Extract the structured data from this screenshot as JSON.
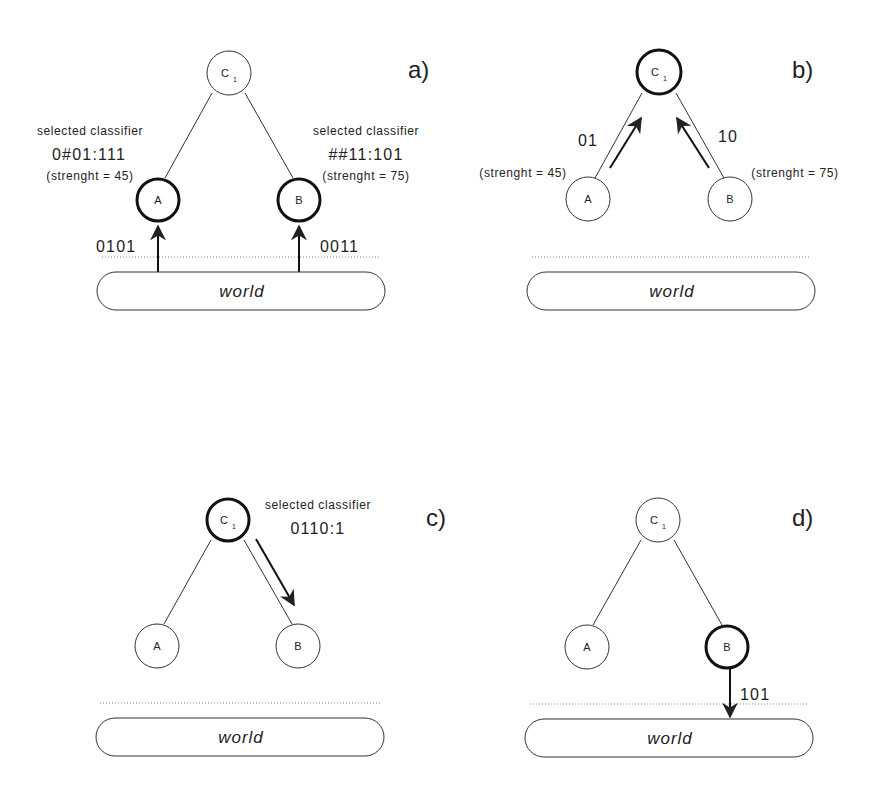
{
  "figure": {
    "panels": [
      {
        "id": "a",
        "label": "a)",
        "nodes": {
          "c1": "C",
          "c1_sub": "1",
          "a": "A",
          "b": "B"
        },
        "highlighted": [
          "A",
          "B"
        ],
        "left_annotation": {
          "title": "selected classifier",
          "code": "0#01:111",
          "strength": "(strenght = 45)"
        },
        "right_annotation": {
          "title": "selected classifier",
          "code": "##11:101",
          "strength": "(strenght = 75)"
        },
        "input_left": "0101",
        "input_right": "0011",
        "world": "world"
      },
      {
        "id": "b",
        "label": "b)",
        "nodes": {
          "c1": "C",
          "c1_sub": "1",
          "a": "A",
          "b": "B"
        },
        "highlighted": [
          "C1"
        ],
        "message_left": "01",
        "message_right": "10",
        "strength_left": "(strenght = 45)",
        "strength_right": "(strenght = 75)",
        "world": "world"
      },
      {
        "id": "c",
        "label": "c)",
        "nodes": {
          "c1": "C",
          "c1_sub": "1",
          "a": "A",
          "b": "B"
        },
        "highlighted": [
          "C1"
        ],
        "annotation": {
          "title": "selected classifier",
          "code": "0110:1"
        },
        "world": "world"
      },
      {
        "id": "d",
        "label": "d)",
        "nodes": {
          "c1": "C",
          "c1_sub": "1",
          "a": "A",
          "b": "B"
        },
        "highlighted": [
          "B"
        ],
        "output": "101",
        "world": "world"
      }
    ],
    "colors": {
      "ink": "#222222",
      "background": "#ffffff",
      "dotted": "#888888"
    }
  }
}
